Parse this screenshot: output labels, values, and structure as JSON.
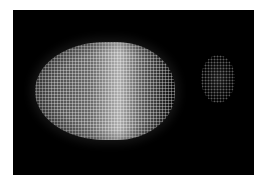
{
  "image": {
    "description": "Fluorescence microscopy image of an oval embryo with densely packed bright nuclei on a black background; a brighter vertical band near the middle and a faint small cluster of nuclei to the right",
    "background_color": "#000000",
    "border_color": "#ffffff",
    "foreground_color": "#c8c8c8"
  }
}
